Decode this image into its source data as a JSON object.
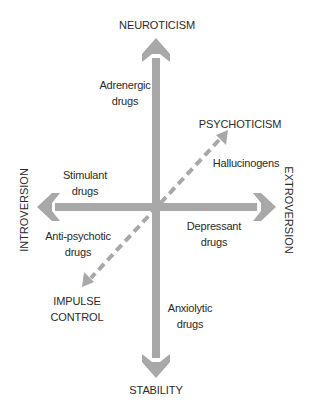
{
  "colors": {
    "arrow": "#a8a8a8",
    "text": "#2a2a2a",
    "background": "#ffffff"
  },
  "axes": {
    "top": "NEUROTICISM",
    "bottom": "STABILITY",
    "left": "INTROVERSION",
    "right": "EXTROVERSION",
    "diagonal_top": "PSYCHOTICISM",
    "diagonal_bottom_line1": "IMPULSE",
    "diagonal_bottom_line2": "CONTROL"
  },
  "drug_labels": {
    "adrenergic_line1": "Adrenergic",
    "adrenergic_line2": "drugs",
    "hallucinogens": "Hallucinogens",
    "stimulant_line1": "Stimulant",
    "stimulant_line2": "drugs",
    "antipsychotic_line1": "Anti-psychotic",
    "antipsychotic_line2": "drugs",
    "depressant_line1": "Depressant",
    "depressant_line2": "drugs",
    "anxiolytic_line1": "Anxiolytic",
    "anxiolytic_line2": "drugs"
  }
}
